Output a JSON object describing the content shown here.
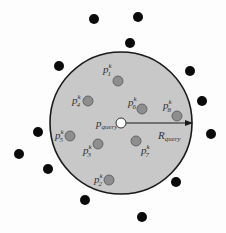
{
  "diagram": {
    "type": "range-query",
    "colors": {
      "background": "#fdfdfd",
      "circle_fill": "#c8c8c8",
      "circle_stroke": "#1a1a1a",
      "inner_point": "#8e8e8e",
      "outer_point": "#0a0a0a",
      "query_point": "#ffffff"
    },
    "circle": {
      "cx": 121,
      "cy": 123,
      "r": 71
    },
    "query": {
      "x": 121,
      "y": 123,
      "label": "p",
      "subscript": "query"
    },
    "radius": {
      "label": "R",
      "subscript": "query"
    },
    "inner_points": [
      {
        "x": 118,
        "y": 81,
        "label": "p",
        "sup": "k",
        "sub": "1",
        "lx": 103,
        "ly": 73
      },
      {
        "x": 88,
        "y": 101,
        "label": "p",
        "sup": "k",
        "sub": "4",
        "lx": 72,
        "ly": 104
      },
      {
        "x": 142,
        "y": 109,
        "label": "p",
        "sup": "k",
        "sub": "6",
        "lx": 128,
        "ly": 106
      },
      {
        "x": 177,
        "y": 116,
        "label": "p",
        "sup": "k",
        "sub": "8",
        "lx": 163,
        "ly": 109
      },
      {
        "x": 70,
        "y": 136,
        "label": "p",
        "sup": "k",
        "sub": "5",
        "lx": 55,
        "ly": 139
      },
      {
        "x": 98,
        "y": 144,
        "label": "p",
        "sup": "k",
        "sub": "3",
        "lx": 83,
        "ly": 154
      },
      {
        "x": 136,
        "y": 141,
        "label": "p",
        "sup": "k",
        "sub": "7",
        "lx": 141,
        "ly": 154
      },
      {
        "x": 109,
        "y": 180,
        "label": "p",
        "sup": "k",
        "sub": "2",
        "lx": 94,
        "ly": 183
      }
    ],
    "outer_points": [
      {
        "x": 94,
        "y": 19
      },
      {
        "x": 138,
        "y": 17
      },
      {
        "x": 130,
        "y": 43
      },
      {
        "x": 59,
        "y": 66
      },
      {
        "x": 190,
        "y": 71
      },
      {
        "x": 202,
        "y": 101
      },
      {
        "x": 38,
        "y": 132
      },
      {
        "x": 211,
        "y": 134
      },
      {
        "x": 19,
        "y": 154
      },
      {
        "x": 48,
        "y": 169
      },
      {
        "x": 176,
        "y": 182
      },
      {
        "x": 85,
        "y": 200
      },
      {
        "x": 142,
        "y": 217
      }
    ]
  }
}
